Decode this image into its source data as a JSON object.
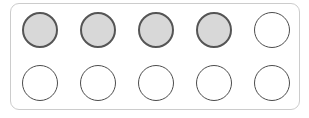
{
  "widget": {
    "name": "ten-frame-counter",
    "total_cells": 10,
    "filled_count": 4,
    "rows": 2,
    "columns": 5,
    "panel": {
      "background_color": "#ffffff",
      "border_color": "#cccccc",
      "corner_radius": "9px"
    },
    "counter_styles": {
      "filled_fill_color": "#d8d8d8",
      "filled_stroke_color": "#555555",
      "empty_fill_color": "#ffffff",
      "empty_stroke_color": "#4c4c4c"
    },
    "grid": [
      {
        "row_index": 0,
        "cells": [
          {
            "index": 1,
            "state": "filled"
          },
          {
            "index": 2,
            "state": "filled"
          },
          {
            "index": 3,
            "state": "filled"
          },
          {
            "index": 4,
            "state": "filled"
          },
          {
            "index": 5,
            "state": "empty"
          }
        ]
      },
      {
        "row_index": 1,
        "cells": [
          {
            "index": 6,
            "state": "empty"
          },
          {
            "index": 7,
            "state": "empty"
          },
          {
            "index": 8,
            "state": "empty"
          },
          {
            "index": 9,
            "state": "empty"
          },
          {
            "index": 10,
            "state": "empty"
          }
        ]
      }
    ]
  }
}
